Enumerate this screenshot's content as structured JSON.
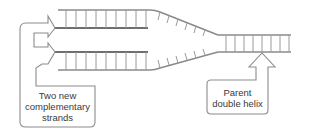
{
  "diagram": {
    "labels": {
      "new_strands": {
        "line1": "Two new",
        "line2": "complementary",
        "line3": "strands"
      },
      "parent": {
        "line1": "Parent",
        "line2": "double helix"
      }
    },
    "colors": {
      "strand": "#8a8a8a",
      "rung": "#9a9a9a",
      "new_strand": "#6e6e6e",
      "callout_outline": "#8c8c8c",
      "text": "#3a3a3a"
    }
  }
}
